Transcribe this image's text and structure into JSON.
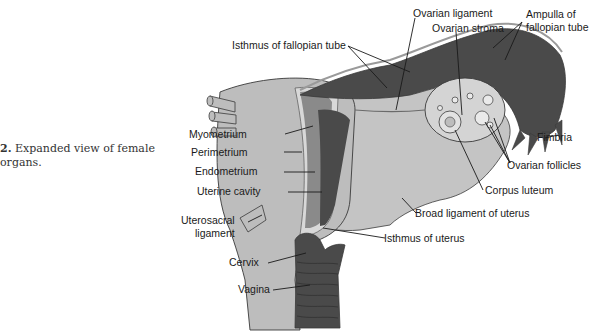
{
  "caption": {
    "figure_number": "2.",
    "line1": "Expanded view of female",
    "line2": "organs."
  },
  "labels": {
    "isthmus_fallopian": "Isthmus of fallopian tube",
    "ovarian_ligament": "Ovarian ligament",
    "ovarian_stroma": "Ovarian stroma",
    "ampulla_1": "Ampulla of",
    "ampulla_2": "fallopian tube",
    "fimbria": "Fimbria",
    "ovarian_follicles": "Ovarian follicles",
    "corpus_luteum": "Corpus luteum",
    "broad_ligament": "Broad ligament of uterus",
    "isthmus_uterus": "Isthmus of uterus",
    "myometrium": "Myometrium",
    "perimetrium": "Perimetrium",
    "endometrium": "Endometrium",
    "uterine_cavity": "Uterine cavity",
    "uterosacral_1": "Uterosacral",
    "uterosacral_2": "ligament",
    "cervix": "Cervix",
    "vagina": "Vagina"
  },
  "colors": {
    "light_tissue": "#bdbdbd",
    "mid_tissue": "#8a8a8a",
    "dark_tissue": "#4a4a4a",
    "outline": "#3a3a3a",
    "text": "#1a1a1a"
  }
}
